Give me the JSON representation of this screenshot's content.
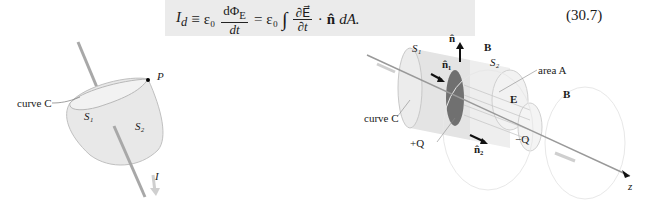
{
  "equation": {
    "lhs": "I",
    "lhs_sub": "d",
    "equiv": "≡",
    "eps0": "ε₀",
    "frac1_num": "dΦ",
    "frac1_num_sub": "E",
    "frac1_den": "dt",
    "equals": "=",
    "eps0_2": "ε₀",
    "integral": "∫",
    "frac2_num": "∂E⃗",
    "frac2_den": "∂t",
    "dot": "·",
    "nhat": "n̂",
    "tail": "dA.",
    "number": "(30.7)"
  },
  "left_figure": {
    "labels": {
      "curve": "curve C",
      "p": "P",
      "s1": "S₁",
      "s2": "S₂",
      "current": "I"
    }
  },
  "right_figure": {
    "labels": {
      "s1": "S₁",
      "s2": "S₂",
      "n": "n̂",
      "n1": "n̂₁",
      "n2": "n̂₂",
      "b1": "B⃗",
      "b2": "B⃗",
      "area": "area A",
      "e": "E⃗",
      "curve": "curve C",
      "plus_q": "+Q",
      "minus_q": "−Q",
      "z": "z"
    }
  },
  "colors": {
    "surface": "#e6e6e6",
    "surface_edge": "#b8b8b8",
    "wire": "#a8a8a8",
    "plate": "#707070",
    "arrow_light": "#cfcfcf",
    "arrow_dark": "#111111"
  }
}
